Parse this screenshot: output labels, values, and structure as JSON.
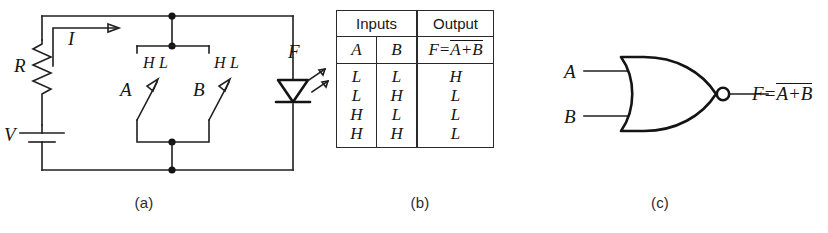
{
  "figure": {
    "panels": [
      {
        "key": "a",
        "caption": "(a)",
        "name": "diode-switch-circuit"
      },
      {
        "key": "b",
        "caption": "(b)",
        "name": "truth-table"
      },
      {
        "key": "c",
        "caption": "(c)",
        "name": "nor-gate-symbol"
      }
    ]
  },
  "circuit": {
    "resistor_label": "R",
    "current_label": "I",
    "source_label": "V",
    "led_label": "F",
    "switch_a_label": "A",
    "switch_b_label": "B",
    "switch_a_positions": {
      "high": "H",
      "low": "L"
    },
    "switch_b_positions": {
      "high": "H",
      "low": "L"
    }
  },
  "table": {
    "header_inputs": "Inputs",
    "header_output": "Output",
    "col_a": "A",
    "col_b": "B",
    "output_expr_prefix": "F=",
    "output_expr_bar": "A+B",
    "rows": [
      {
        "a": "L",
        "b": "L",
        "f": "H"
      },
      {
        "a": "L",
        "b": "H",
        "f": "L"
      },
      {
        "a": "H",
        "b": "L",
        "f": "L"
      },
      {
        "a": "H",
        "b": "H",
        "f": "L"
      }
    ]
  },
  "gate": {
    "type": "NOR",
    "input_a": "A",
    "input_b": "B",
    "output_expr_prefix": "F=",
    "output_expr_bar": "A+B"
  },
  "colors": {
    "ink": "#1a1a1a",
    "background": "#ffffff"
  }
}
